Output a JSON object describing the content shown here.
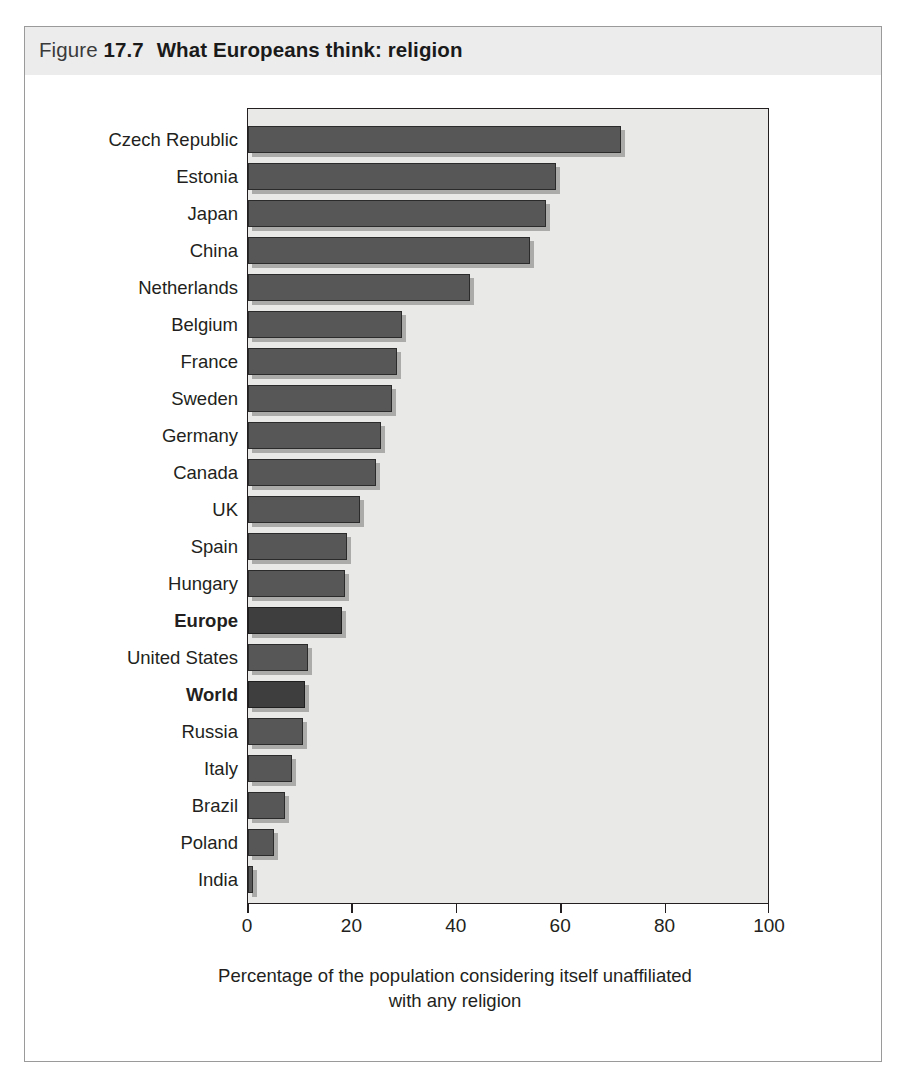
{
  "figure": {
    "label_word": "Figure",
    "number": "17.7",
    "title": "What Europeans think: religion"
  },
  "chart_data": {
    "type": "bar",
    "orientation": "horizontal",
    "title": "What Europeans think: religion",
    "xlabel": "Percentage of the population considering itself unaffiliated with any religion",
    "ylabel": "",
    "xlim": [
      0,
      100
    ],
    "xticks": [
      0,
      20,
      40,
      60,
      80,
      100
    ],
    "xtick_labels": [
      "0",
      "20",
      "40",
      "60",
      "80",
      "100"
    ],
    "grid": false,
    "legend": null,
    "series_colors": {
      "normal_bar": "#575757",
      "highlight_bar": "#3e3e3e",
      "plot_background": "#e9e9e7",
      "axis": "#231f20",
      "header_band": "#ececec"
    },
    "categories": [
      "Czech Republic",
      "Estonia",
      "Japan",
      "China",
      "Netherlands",
      "Belgium",
      "France",
      "Sweden",
      "Germany",
      "Canada",
      "UK",
      "Spain",
      "Hungary",
      "Europe",
      "United States",
      "World",
      "Russia",
      "Italy",
      "Brazil",
      "Poland",
      "India"
    ],
    "values": [
      71.5,
      59,
      57,
      54,
      42.5,
      29.5,
      28.5,
      27.5,
      25.5,
      24.5,
      21.5,
      19,
      18.5,
      18,
      11.5,
      11,
      10.5,
      8.5,
      7,
      5,
      1
    ],
    "highlighted": [
      "Europe",
      "World"
    ]
  },
  "x_axis": {
    "title_line1": "Percentage of the population considering itself unaffiliated",
    "title_line2": "with any religion"
  }
}
